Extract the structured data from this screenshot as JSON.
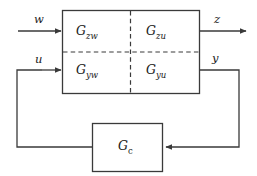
{
  "diagram": {
    "type": "block-diagram",
    "stroke_color": "#3a3a3a",
    "text_color": "#1a1a1a",
    "background": "#ffffff",
    "plant": {
      "name": "generalized-plant",
      "quadrants": [
        {
          "id": "upper-left",
          "base": "G",
          "sub": "zw"
        },
        {
          "id": "upper-right",
          "base": "G",
          "sub": "zu"
        },
        {
          "id": "lower-left",
          "base": "G",
          "sub": "yw"
        },
        {
          "id": "lower-right",
          "base": "G",
          "sub": "yu"
        }
      ]
    },
    "controller": {
      "name": "controller-block",
      "base": "G",
      "sub": "c"
    },
    "signals": {
      "exogenous_input": "w",
      "control_input": "u",
      "performance_output": "z",
      "measured_output": "y"
    }
  }
}
